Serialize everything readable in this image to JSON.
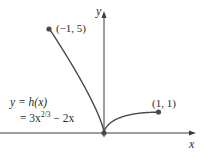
{
  "chart_data": {
    "type": "line",
    "title": "",
    "xlabel": "x",
    "ylabel": "y",
    "function_label_line1": "y = h(x)",
    "function_label_line2_prefix": "= 3x",
    "function_label_exponent": "2/3",
    "function_label_line2_suffix": " − 2x",
    "expression": "h(x) = 3x^(2/3) - 2x",
    "domain": [
      -1,
      1
    ],
    "xlim": [
      -1.9,
      1.7
    ],
    "ylim": [
      -0.5,
      5.9
    ],
    "grid": false,
    "legend": "none",
    "series": [
      {
        "name": "y = h(x) = 3x^(2/3) − 2x",
        "x": [
          -1,
          -0.8,
          -0.6,
          -0.4,
          -0.2,
          -0.1,
          -0.05,
          0,
          0.05,
          0.1,
          0.2,
          0.3,
          0.4,
          0.6,
          0.8,
          1
        ],
        "y": [
          5,
          4.185,
          3.334,
          2.429,
          1.426,
          0.846,
          0.507,
          0,
          0.307,
          0.446,
          0.626,
          0.744,
          0.829,
          0.931,
          0.985,
          1
        ]
      }
    ],
    "marked_points": [
      {
        "x": -1,
        "y": 5,
        "label": "(−1, 5)"
      },
      {
        "x": 0,
        "y": 0,
        "label": ""
      },
      {
        "x": 1,
        "y": 1,
        "label": "(1, 1)"
      }
    ],
    "annotations": [
      "(−1, 5)",
      "(1, 1)",
      "y = h(x) = 3x^(2/3) − 2x"
    ],
    "colors": {
      "curve": "#4a4a4a",
      "axes": "#3a3a3a",
      "points": "#4a4a4a",
      "background": "#ffffff"
    }
  }
}
